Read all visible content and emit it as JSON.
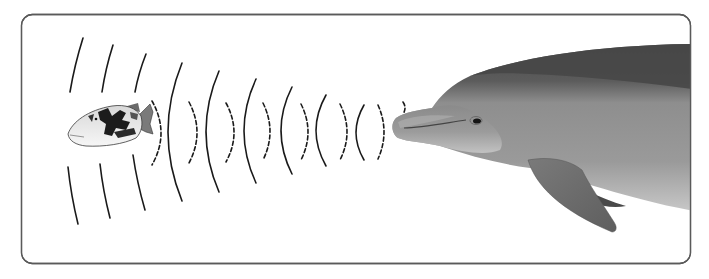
{
  "diagram": {
    "frame": {
      "x": 21.5,
      "y": 14.5,
      "width": 669,
      "height": 249,
      "radius": 11,
      "stroke": "#5a5a5a"
    },
    "colors": {
      "background": "#ffffff",
      "wave": "#1a1a1a",
      "dolphin_back": "#4e4e4e",
      "dolphin_body": "#8a8a8a",
      "dolphin_belly": "#c4c4c4",
      "dolphin_fin": "#6e6e6e",
      "fish_light": "#efefef",
      "fish_dark": "#1c1c1c",
      "fish_fin": "#7a7a7a"
    },
    "outgoing_waves_label": "solid arcs (clicks emitted by dolphin)",
    "echo_waves_label": "dashed arcs (echoes returning from fish)",
    "outgoing_waves": [
      {
        "x": 182,
        "top": 63,
        "bottom": 201,
        "bulge": -14
      },
      {
        "x": 219,
        "top": 71,
        "bottom": 192,
        "bulge": -13
      },
      {
        "x": 256,
        "top": 79,
        "bottom": 183,
        "bulge": -12
      },
      {
        "x": 292,
        "top": 87,
        "bottom": 174,
        "bulge": -11
      },
      {
        "x": 326,
        "top": 95,
        "bottom": 166,
        "bulge": -10
      },
      {
        "x": 364,
        "top": 105,
        "bottom": 160,
        "bulge": -8
      }
    ],
    "blocked_waves_top": [
      {
        "x1": 83,
        "y1": 38,
        "x2": 70,
        "y2": 92
      },
      {
        "x1": 113,
        "y1": 45,
        "x2": 102,
        "y2": 92
      },
      {
        "x1": 146,
        "y1": 54,
        "x2": 135,
        "y2": 92
      }
    ],
    "blocked_waves_bottom": [
      {
        "x1": 68,
        "y1": 167,
        "x2": 78,
        "y2": 224
      },
      {
        "x1": 100,
        "y1": 164,
        "x2": 110,
        "y2": 218
      },
      {
        "x1": 133,
        "y1": 155,
        "x2": 145,
        "y2": 210
      }
    ],
    "echo_waves": [
      {
        "x": 152,
        "top": 101,
        "bottom": 165,
        "bulge": 9
      },
      {
        "x": 189,
        "top": 102,
        "bottom": 163,
        "bulge": 8
      },
      {
        "x": 226,
        "top": 103,
        "bottom": 162,
        "bulge": 8
      },
      {
        "x": 263,
        "top": 103,
        "bottom": 160,
        "bulge": 7
      },
      {
        "x": 301,
        "top": 104,
        "bottom": 160,
        "bulge": 7
      },
      {
        "x": 340,
        "top": 104,
        "bottom": 160,
        "bulge": 7
      },
      {
        "x": 378,
        "top": 105,
        "bottom": 159,
        "bulge": 6
      },
      {
        "x": 403,
        "top": 102,
        "bottom": 114,
        "bulge": 2
      }
    ]
  }
}
